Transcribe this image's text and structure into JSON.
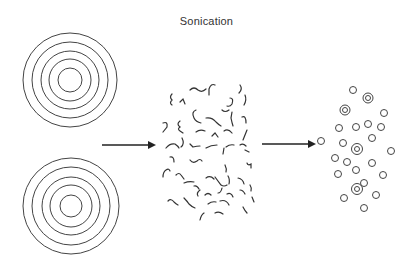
{
  "title": "Sonication",
  "colors": {
    "stroke": "#333333",
    "background": "#ffffff"
  },
  "diagram": {
    "stages": [
      {
        "name": "multilamellar-vesicles",
        "description": "Two large concentric multilamellar circles"
      },
      {
        "name": "lipid-fragments",
        "description": "Scattered short curved bilayer fragments"
      },
      {
        "name": "small-vesicles",
        "description": "Many small unilamellar vesicles, some bilamellar"
      }
    ],
    "arrows": 2
  }
}
